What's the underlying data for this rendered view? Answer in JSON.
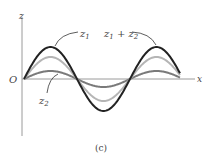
{
  "figure": {
    "caption": "(c)",
    "axes": {
      "vertical_label": "z",
      "horizontal_label": "x",
      "origin_label": "O"
    },
    "curves": [
      {
        "name": "z1",
        "label": "z",
        "label_sub": "1",
        "amplitude": 22,
        "color": "#b5b5b5"
      },
      {
        "name": "z2",
        "label": "z",
        "label_sub": "2",
        "amplitude": 8,
        "color": "#7a7a7a"
      },
      {
        "name": "z1+z2",
        "label": "z",
        "label_sub1": "1",
        "label_plus": " + z",
        "label_sub2": "2",
        "amplitude": 32,
        "color": "#222222"
      }
    ]
  },
  "chart_data": {
    "type": "line",
    "title": "",
    "xlabel": "x",
    "ylabel": "z",
    "caption": "(c)",
    "series": [
      {
        "name": "z1",
        "description": "sine wave, medium amplitude, in phase",
        "relative_amplitude": 0.7
      },
      {
        "name": "z2",
        "description": "sine wave, small amplitude, in phase",
        "relative_amplitude": 0.25
      },
      {
        "name": "z1 + z2",
        "description": "superposition (sum), largest amplitude",
        "relative_amplitude": 1.0
      }
    ],
    "x_range_periods": 1.5,
    "grid": false
  }
}
